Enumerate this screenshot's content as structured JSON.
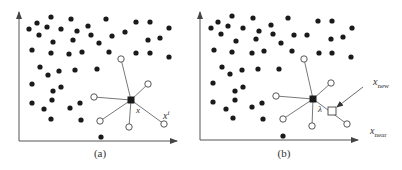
{
  "colors": {
    "ink": "#1a1a1a",
    "line": "#555555",
    "bg": "#ffffff"
  },
  "panels": [
    {
      "id": "a",
      "caption": "(a)",
      "caption_pos": [
        100,
        157
      ],
      "axes": {
        "origin": [
          19,
          141
        ],
        "x_end": 177,
        "y_top": 12
      },
      "dots": [
        [
          51,
          17
        ],
        [
          37,
          23
        ],
        [
          29,
          29
        ],
        [
          47,
          27
        ],
        [
          71,
          19
        ],
        [
          106,
          19
        ],
        [
          136,
          22
        ],
        [
          150,
          22
        ],
        [
          169,
          28
        ],
        [
          61,
          29
        ],
        [
          88,
          26
        ],
        [
          77,
          31
        ],
        [
          39,
          35
        ],
        [
          91,
          35
        ],
        [
          112,
          36
        ],
        [
          125,
          32
        ],
        [
          53,
          42
        ],
        [
          73,
          40
        ],
        [
          99,
          43
        ],
        [
          148,
          40
        ],
        [
          160,
          38
        ],
        [
          32,
          50
        ],
        [
          51,
          53
        ],
        [
          69,
          54
        ],
        [
          82,
          52
        ],
        [
          109,
          52
        ],
        [
          136,
          53
        ],
        [
          150,
          53
        ],
        [
          169,
          57
        ],
        [
          40,
          67
        ],
        [
          48,
          75
        ],
        [
          59,
          71
        ],
        [
          75,
          70
        ],
        [
          97,
          69
        ],
        [
          32,
          84
        ],
        [
          61,
          87
        ],
        [
          53,
          91
        ],
        [
          52,
          100
        ],
        [
          32,
          103
        ],
        [
          44,
          109
        ],
        [
          70,
          108
        ],
        [
          80,
          103
        ],
        [
          51,
          119
        ],
        [
          81,
          120
        ],
        [
          101,
          137
        ]
      ],
      "center": [
        131,
        100
      ],
      "center_label": {
        "text": "x",
        "pos": [
          136,
          113
        ]
      },
      "neighbors": [
        [
          121,
          59
        ],
        [
          148,
          84
        ],
        [
          94,
          97
        ],
        [
          100,
          121
        ],
        [
          129,
          127
        ],
        [
          164,
          124
        ]
      ],
      "extra_labels": [
        {
          "text": "x",
          "sup": "i",
          "pos": [
            163,
            119
          ]
        }
      ]
    },
    {
      "id": "b",
      "caption": "(b)",
      "caption_pos": [
        284,
        157
      ],
      "axes": {
        "origin": [
          200,
          140
        ],
        "x_end": 358,
        "y_top": 12
      },
      "dots": [
        [
          232,
          16
        ],
        [
          218,
          22
        ],
        [
          211,
          28
        ],
        [
          228,
          26
        ],
        [
          253,
          18
        ],
        [
          288,
          18
        ],
        [
          318,
          21
        ],
        [
          332,
          21
        ],
        [
          352,
          28
        ],
        [
          243,
          28
        ],
        [
          271,
          25
        ],
        [
          259,
          31
        ],
        [
          221,
          34
        ],
        [
          273,
          34
        ],
        [
          294,
          35
        ],
        [
          307,
          35
        ],
        [
          236,
          41
        ],
        [
          256,
          39
        ],
        [
          281,
          43
        ],
        [
          331,
          39
        ],
        [
          343,
          37
        ],
        [
          214,
          50
        ],
        [
          232,
          52
        ],
        [
          252,
          53
        ],
        [
          264,
          51
        ],
        [
          292,
          51
        ],
        [
          319,
          53
        ],
        [
          332,
          53
        ],
        [
          351,
          57
        ],
        [
          222,
          67
        ],
        [
          230,
          74
        ],
        [
          242,
          70
        ],
        [
          258,
          69
        ],
        [
          279,
          69
        ],
        [
          213,
          83
        ],
        [
          243,
          87
        ],
        [
          235,
          91
        ],
        [
          235,
          100
        ],
        [
          213,
          102
        ],
        [
          226,
          109
        ],
        [
          252,
          107
        ],
        [
          262,
          103
        ],
        [
          233,
          118
        ],
        [
          263,
          119
        ],
        [
          283,
          136
        ]
      ],
      "center": [
        313,
        99
      ],
      "center_label": {
        "text": "λ",
        "pos": [
          318,
          112
        ]
      },
      "neighbors": [
        [
          304,
          59
        ],
        [
          331,
          83
        ],
        [
          276,
          96
        ],
        [
          283,
          119
        ],
        [
          312,
          126
        ],
        [
          347,
          124
        ]
      ],
      "new_node": {
        "pos": [
          332,
          111
        ],
        "size": 8
      },
      "arrow": {
        "from": [
          363,
          87
        ],
        "to": [
          337,
          107
        ]
      },
      "extra_labels": [
        {
          "text": "x",
          "sub": "new",
          "pos": [
            373,
            85
          ]
        },
        {
          "text": "x",
          "sub": "near",
          "pos": [
            370,
            134
          ]
        }
      ]
    }
  ]
}
